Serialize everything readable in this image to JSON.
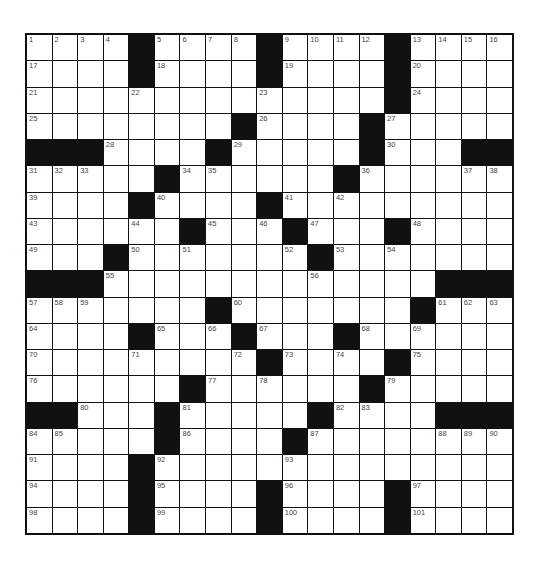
{
  "puzzle": {
    "rows": 19,
    "cols": 19,
    "colors": {
      "block": "#111111",
      "cell": "#ffffff",
      "number": "#444444",
      "border": "#111111"
    },
    "grid": [
      [
        "1",
        "2",
        "3",
        "4",
        "#",
        "5",
        "6",
        "7",
        "8",
        "#",
        "9",
        "10",
        "11",
        "12",
        "#",
        "13",
        "14",
        "15",
        "16"
      ],
      [
        "17",
        ".",
        ".",
        ".",
        "#",
        "18",
        ".",
        ".",
        ".",
        "#",
        "19",
        ".",
        ".",
        ".",
        "#",
        "20",
        ".",
        ".",
        "."
      ],
      [
        "21",
        ".",
        ".",
        ".",
        "22",
        ".",
        ".",
        ".",
        ".",
        "23",
        ".",
        ".",
        ".",
        ".",
        "#",
        "24",
        ".",
        ".",
        "."
      ],
      [
        "25",
        ".",
        ".",
        ".",
        ".",
        ".",
        ".",
        ".",
        "#",
        "26",
        ".",
        ".",
        ".",
        "#",
        "27",
        ".",
        ".",
        ".",
        "."
      ],
      [
        "#",
        "#",
        "#",
        "28",
        ".",
        ".",
        ".",
        "#",
        "29",
        ".",
        ".",
        ".",
        ".",
        "#",
        "30",
        ".",
        ".",
        "#",
        "#"
      ],
      [
        "31",
        "32",
        "33",
        ".",
        ".",
        "#",
        "34",
        "35",
        ".",
        ".",
        ".",
        ".",
        "#",
        "36",
        ".",
        ".",
        ".",
        "37",
        "38"
      ],
      [
        "39",
        ".",
        ".",
        ".",
        "#",
        "40",
        ".",
        ".",
        ".",
        "#",
        "41",
        ".",
        "42",
        ".",
        ".",
        ".",
        ".",
        ".",
        "."
      ],
      [
        "43",
        ".",
        ".",
        ".",
        "44",
        ".",
        "#",
        "45",
        ".",
        "46",
        "#",
        "47",
        ".",
        ".",
        "#",
        "48",
        ".",
        ".",
        "."
      ],
      [
        "49",
        ".",
        ".",
        "#",
        "50",
        ".",
        "51",
        ".",
        ".",
        ".",
        "52",
        "#",
        "53",
        ".",
        "54",
        ".",
        ".",
        ".",
        "."
      ],
      [
        "#",
        "#",
        "#",
        "55",
        ".",
        ".",
        ".",
        ".",
        ".",
        ".",
        ".",
        "56",
        ".",
        ".",
        ".",
        ".",
        "#",
        "#",
        "#"
      ],
      [
        "57",
        "58",
        "59",
        ".",
        ".",
        ".",
        ".",
        "#",
        "60",
        ".",
        ".",
        ".",
        ".",
        ".",
        ".",
        "#",
        "61",
        "62",
        "63"
      ],
      [
        "64",
        ".",
        ".",
        ".",
        "#",
        "65",
        ".",
        "66",
        "#",
        "67",
        ".",
        ".",
        "#",
        "68",
        ".",
        "69",
        ".",
        ".",
        "."
      ],
      [
        "70",
        ".",
        ".",
        ".",
        "71",
        ".",
        ".",
        ".",
        "72",
        "#",
        "73",
        ".",
        "74",
        ".",
        "#",
        "75",
        ".",
        ".",
        "."
      ],
      [
        "76",
        ".",
        ".",
        ".",
        ".",
        ".",
        "#",
        "77",
        ".",
        "78",
        ".",
        ".",
        ".",
        "#",
        "79",
        ".",
        ".",
        ".",
        "."
      ],
      [
        "#",
        "#",
        "80",
        ".",
        ".",
        "#",
        "81",
        ".",
        ".",
        ".",
        ".",
        "#",
        "82",
        "83",
        ".",
        ".",
        "#",
        "#",
        "#"
      ],
      [
        "84",
        "85",
        ".",
        ".",
        ".",
        "#",
        "86",
        ".",
        ".",
        ".",
        "#",
        "87",
        ".",
        ".",
        ".",
        ".",
        "88",
        "89",
        "90"
      ],
      [
        "91",
        ".",
        ".",
        ".",
        "#",
        "92",
        ".",
        ".",
        ".",
        ".",
        "93",
        ".",
        ".",
        ".",
        ".",
        ".",
        ".",
        ".",
        "."
      ],
      [
        "94",
        ".",
        ".",
        ".",
        "#",
        "95",
        ".",
        ".",
        ".",
        "#",
        "96",
        ".",
        ".",
        ".",
        "#",
        "97",
        ".",
        ".",
        "."
      ],
      [
        "98",
        ".",
        ".",
        ".",
        "#",
        "99",
        ".",
        ".",
        ".",
        "#",
        "100",
        ".",
        ".",
        ".",
        "#",
        "101",
        ".",
        ".",
        "."
      ]
    ]
  }
}
